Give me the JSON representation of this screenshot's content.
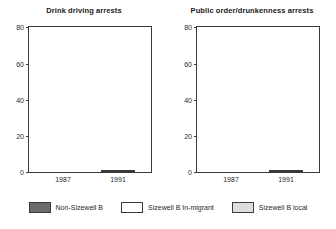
{
  "figure": {
    "series_colors": {
      "non_sizewell_b": "#6b6b6b",
      "sizewell_b_in_migrant": "#ffffff",
      "sizewell_b_local": "#dedede",
      "axis": "#3a3a3a"
    }
  },
  "legend": {
    "position": "bottom",
    "items": [
      {
        "label": "Non-Sizewell B",
        "swatch": "non-sw"
      },
      {
        "label": "Sizewell B In-migrant",
        "swatch": "sw-inmig"
      },
      {
        "label": "Sizewell B local",
        "swatch": "sw-local"
      }
    ]
  },
  "chart_data": [
    {
      "type": "bar",
      "subtype": "stacked",
      "title": "Drink driving arrests",
      "xlabel": "",
      "ylabel": "",
      "categories": [
        "1987",
        "1991"
      ],
      "ylim": [
        0,
        80
      ],
      "yticks": [
        0,
        20,
        40,
        60,
        80
      ],
      "ytick_labels": [
        "0",
        "20",
        "40",
        "60",
        "80"
      ],
      "grid": false,
      "series": [
        {
          "name": "Sizewell B local",
          "values": [
            0,
            7
          ]
        },
        {
          "name": "Sizewell B In-migrant",
          "values": [
            0,
            33
          ]
        },
        {
          "name": "Non-Sizewell B",
          "values": [
            5,
            31
          ]
        }
      ],
      "totals": [
        5,
        71
      ]
    },
    {
      "type": "bar",
      "subtype": "stacked",
      "title": "Public order/drunkenness arrests",
      "xlabel": "",
      "ylabel": "",
      "categories": [
        "1987",
        "1991"
      ],
      "ylim": [
        0,
        80
      ],
      "yticks": [
        0,
        20,
        40,
        60,
        80
      ],
      "ytick_labels": [
        "0",
        "20",
        "40",
        "60",
        "80"
      ],
      "grid": false,
      "series": [
        {
          "name": "Sizewell B local",
          "values": [
            0,
            11
          ]
        },
        {
          "name": "Sizewell B In-migrant",
          "values": [
            0,
            13
          ]
        },
        {
          "name": "Non-Sizewell B",
          "values": [
            12,
            36
          ]
        }
      ],
      "totals": [
        12,
        60
      ]
    }
  ]
}
